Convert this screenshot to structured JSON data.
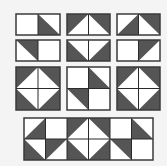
{
  "colors": {
    "background": "#f4f4f4",
    "dark": "#555555",
    "light": "#ffffff",
    "stroke": "#2a2a2a"
  },
  "options": [
    {
      "id": "option-1",
      "row": 0,
      "col": 0,
      "halves": [
        {
          "pos": "top",
          "cells": [
            {
              "fill": "none"
            },
            {
              "fill": "dark",
              "tri": [
                "TL",
                "BL",
                "BR"
              ]
            }
          ]
        },
        {
          "pos": "bottom",
          "cells": [
            {
              "fill": "dark",
              "tri": [
                "TL",
                "TR",
                "BR"
              ]
            },
            {
              "fill": "none"
            }
          ]
        }
      ]
    },
    {
      "id": "option-2",
      "row": 0,
      "col": 1
    },
    {
      "id": "option-3",
      "row": 0,
      "col": 2
    },
    {
      "id": "option-4",
      "row": 1,
      "col": 0
    },
    {
      "id": "option-5",
      "row": 1,
      "col": 1
    },
    {
      "id": "option-6",
      "row": 1,
      "col": 2
    }
  ],
  "strip": {
    "columns": 6,
    "rows": 2
  }
}
